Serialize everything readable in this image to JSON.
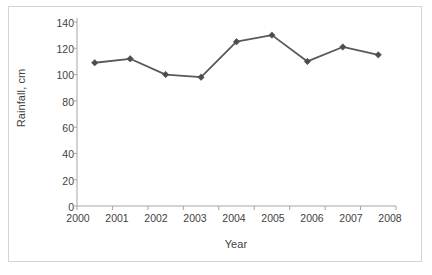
{
  "chart_data": {
    "type": "line",
    "title": "",
    "xlabel": "Year",
    "ylabel": "Rainfall, cm",
    "categories": [
      "2000",
      "2001",
      "2002",
      "2003",
      "2004",
      "2005",
      "2006",
      "2007",
      "2008"
    ],
    "values": [
      109,
      112,
      100,
      98,
      125,
      130,
      110,
      121,
      115
    ],
    "ylim": [
      0,
      140
    ],
    "ytick_labels": [
      "0",
      "20",
      "40",
      "60",
      "80",
      "100",
      "120",
      "140"
    ],
    "ytick_values": [
      0,
      20,
      40,
      60,
      80,
      100,
      120,
      140
    ],
    "grid": false,
    "legend": false,
    "legend_position": "none",
    "series": [
      {
        "name": "Rainfall, cm",
        "values": [
          109,
          112,
          100,
          98,
          125,
          130,
          110,
          121,
          115
        ],
        "color": "#595959",
        "marker": "diamond"
      }
    ]
  },
  "colors": {
    "line": "#595959",
    "marker": "#4d4d4d",
    "axis": "#a6a6a6",
    "tick_text": "#3f3f3f",
    "frame_border": "#d4d4d4",
    "background": "#ffffff"
  }
}
